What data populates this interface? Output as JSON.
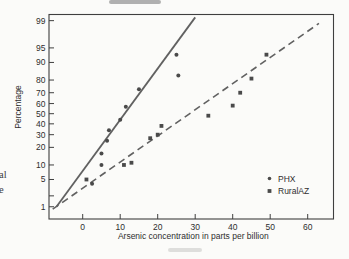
{
  "page": {
    "background": "#fbfbf9",
    "cropped_margin_text": [
      "al",
      "e"
    ]
  },
  "chart_data": {
    "type": "scatter",
    "subtype": "normal-probability-plot",
    "title": "",
    "xlabel": "Arsenic concentration in parts per billion",
    "ylabel": "Percentage",
    "x_ticks": [
      0,
      10,
      20,
      30,
      40,
      50,
      60
    ],
    "xlim": [
      -9,
      66.5
    ],
    "y_scale": "probit-percent",
    "ylim_percent": [
      0.45,
      99.4
    ],
    "grid": false,
    "y_ticks": [
      {
        "p": 99,
        "label": "99"
      },
      {
        "p": 95,
        "label": "95"
      },
      {
        "p": 90,
        "label": "90"
      },
      {
        "p": 80,
        "label": "80"
      },
      {
        "p": 70,
        "label": "70"
      },
      {
        "p": 60,
        "label": "60"
      },
      {
        "p": 50,
        "label": "50"
      },
      {
        "p": 40,
        "label": "40"
      },
      {
        "p": 30,
        "label": "30"
      },
      {
        "p": 20,
        "label": "20"
      },
      {
        "p": 10,
        "label": "10"
      },
      {
        "p": 5,
        "label": "5"
      },
      {
        "p": 2,
        "label": ""
      },
      {
        "p": 1,
        "label": "1"
      }
    ],
    "series": [
      {
        "name": "PHX",
        "marker": "dot",
        "points": [
          [
            2.5,
            4
          ],
          [
            5,
            10
          ],
          [
            5,
            16
          ],
          [
            6.5,
            25
          ],
          [
            7,
            34
          ],
          [
            10,
            44
          ],
          [
            11.5,
            57
          ],
          [
            15,
            73
          ],
          [
            25.5,
            83
          ],
          [
            25,
            93
          ]
        ],
        "trend_line": {
          "style": "solid",
          "from": [
            -7,
            1
          ],
          "to": [
            30,
            99.2
          ]
        }
      },
      {
        "name": "RuralAZ",
        "marker": "square",
        "points": [
          [
            1,
            5
          ],
          [
            11,
            10
          ],
          [
            13,
            11
          ],
          [
            18,
            27
          ],
          [
            20,
            30
          ],
          [
            21,
            38
          ],
          [
            33.5,
            48
          ],
          [
            40,
            58
          ],
          [
            42,
            70
          ],
          [
            45,
            81
          ],
          [
            49,
            93
          ]
        ],
        "trend_line": {
          "style": "dashed",
          "from": [
            -8,
            0.85
          ],
          "to": [
            63,
            98.8
          ]
        }
      }
    ],
    "legend": {
      "position": "lower-right",
      "items": [
        {
          "label": "PHX",
          "marker": "dot"
        },
        {
          "label": "RuralAZ",
          "marker": "square"
        }
      ]
    },
    "colors": {
      "frame": "#3f3f3f",
      "text": "#2e2e2e",
      "marker": "#4a4a4a",
      "line": "#616161"
    }
  }
}
